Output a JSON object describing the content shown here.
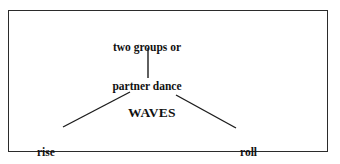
{
  "diagram": {
    "type": "tree-branch",
    "border_color": "#2b2b2b",
    "text_color": "#111111",
    "background": "#ffffff",
    "nodes": {
      "top": {
        "name": "two-groups-or-partner-dance",
        "lines": [
          "two groups or",
          "partner dance"
        ]
      },
      "center": {
        "name": "waves",
        "lines": [
          "WAVES"
        ]
      },
      "left": {
        "name": "rise-sink",
        "lines": [
          "rise",
          "sink"
        ]
      },
      "right": {
        "name": "roll-press-upwards",
        "lines": [
          "roll",
          "press upwards"
        ]
      }
    },
    "connectors": [
      {
        "name": "connector-top-to-center",
        "from": "top",
        "to": "center",
        "x1": 148,
        "y1": 48,
        "x2": 148,
        "y2": 78
      },
      {
        "name": "connector-center-to-left",
        "from": "center",
        "to": "left",
        "x1": 130,
        "y1": 92,
        "x2": 63,
        "y2": 127
      },
      {
        "name": "connector-center-to-right",
        "from": "center",
        "to": "right",
        "x1": 176,
        "y1": 95,
        "x2": 236,
        "y2": 128
      }
    ]
  }
}
